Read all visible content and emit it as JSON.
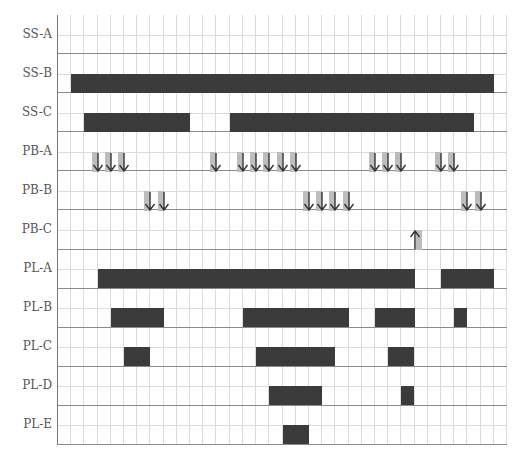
{
  "chart_data": {
    "type": "gantt",
    "title": "",
    "xlabel": "",
    "ylabel": "",
    "columns": 34,
    "grid": true,
    "rows": [
      {
        "label": "SS-A",
        "bars": [],
        "arrows_down": [],
        "arrows_up": []
      },
      {
        "label": "SS-B",
        "bars": [
          [
            1,
            33
          ]
        ],
        "arrows_down": [],
        "arrows_up": []
      },
      {
        "label": "SS-C",
        "bars": [
          [
            2,
            10
          ],
          [
            13,
            31.5
          ]
        ],
        "arrows_down": [],
        "arrows_up": []
      },
      {
        "label": "PB-A",
        "bars": [],
        "arrows_down": [
          3,
          4,
          5,
          12,
          14,
          15,
          16,
          17,
          18,
          24,
          25,
          26,
          29,
          30
        ],
        "arrows_up": []
      },
      {
        "label": "PB-B",
        "bars": [],
        "arrows_down": [
          7,
          8,
          19,
          20,
          21,
          22,
          31,
          32
        ],
        "arrows_up": []
      },
      {
        "label": "PB-C",
        "bars": [],
        "arrows_down": [],
        "arrows_up": [
          27
        ]
      },
      {
        "label": "PL-A",
        "bars": [
          [
            3,
            27
          ],
          [
            29,
            33
          ]
        ],
        "arrows_down": [],
        "arrows_up": []
      },
      {
        "label": "PL-B",
        "bars": [
          [
            4,
            8
          ],
          [
            14,
            22
          ],
          [
            24,
            27
          ],
          [
            30,
            31
          ]
        ],
        "arrows_down": [],
        "arrows_up": []
      },
      {
        "label": "PL-C",
        "bars": [
          [
            5,
            7
          ],
          [
            15,
            21
          ],
          [
            25,
            27
          ]
        ],
        "arrows_down": [],
        "arrows_up": []
      },
      {
        "label": "PL-D",
        "bars": [
          [
            16,
            20
          ],
          [
            26,
            27
          ]
        ],
        "arrows_down": [],
        "arrows_up": []
      },
      {
        "label": "PL-E",
        "bars": [
          [
            17,
            19
          ]
        ],
        "arrows_down": [],
        "arrows_up": []
      }
    ],
    "colors": {
      "bar": "#3b3b3b",
      "arrow": "#333333",
      "arrow_shade": "#bdbdbd",
      "grid_minor": "#dcdcdc",
      "grid_major": "#8a8a8a",
      "label": "#555555"
    }
  }
}
